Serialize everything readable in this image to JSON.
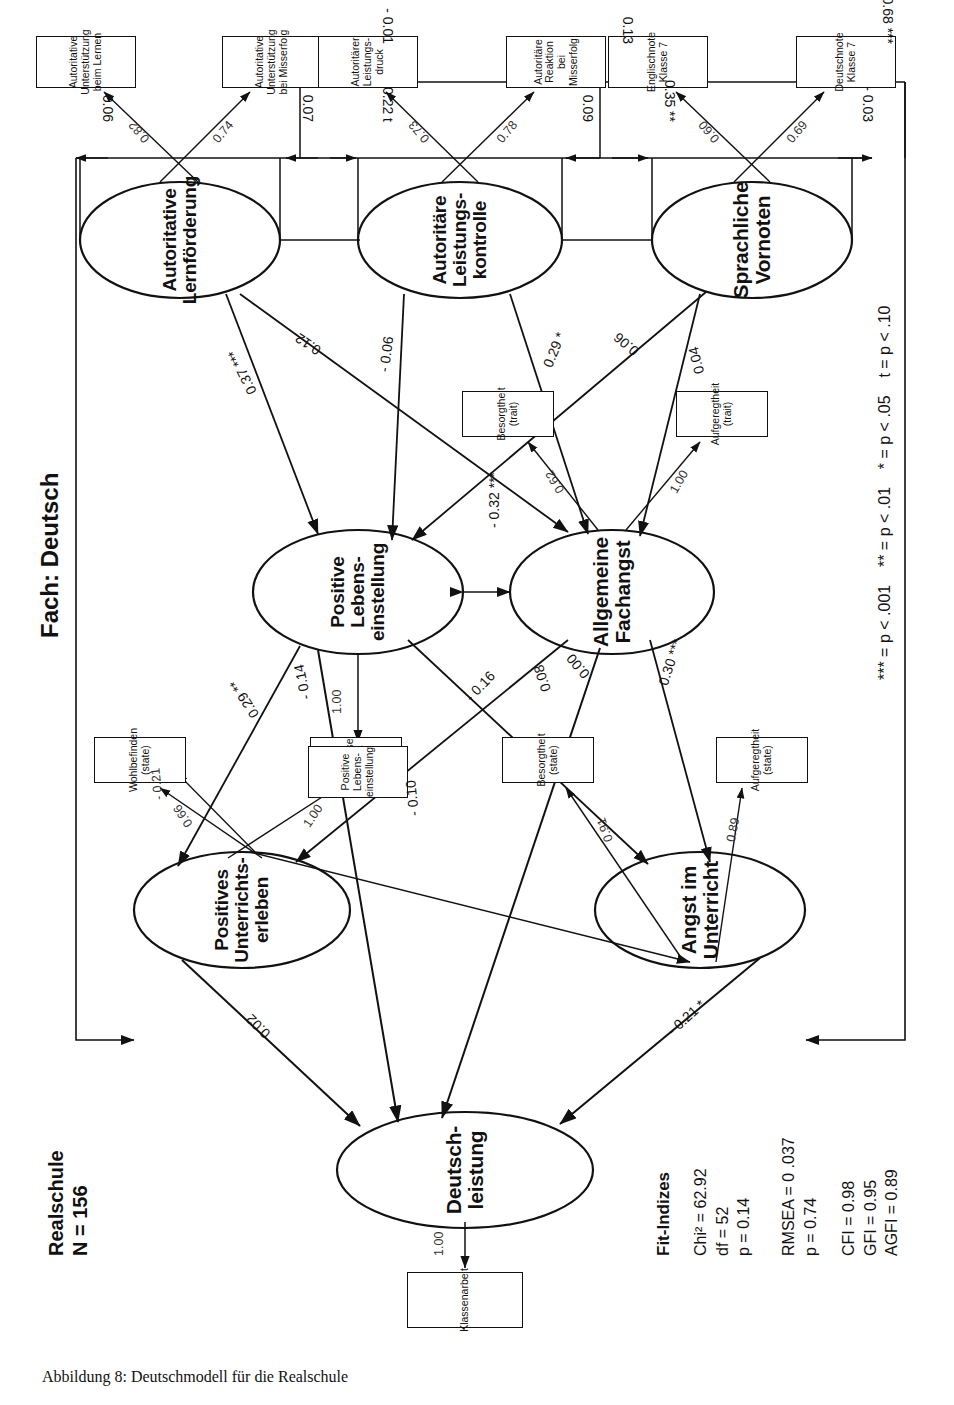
{
  "figure": {
    "caption": "Abbildung 8: Deutschmodell für die Realschule",
    "sample_header": "Realschule\nN = 156",
    "subject_header": "Fach: Deutsch"
  },
  "fit": {
    "title": "Fit-Indizes",
    "group1": "Chi² = 62.92\ndf = 52\np = 0.14",
    "group2": "RMSEA = 0 .037\np = 0.74",
    "group3": "CFI = 0.98\nGFI = 0.95\nAGFI = 0.89"
  },
  "legend": {
    "text": "*** = p < .001    ** = p < .01    * = p < .05    t = p < .10"
  },
  "latents": [
    {
      "id": "deutschleistung",
      "label": "Deutsch-\nleistung"
    },
    {
      "id": "pos_unterricht",
      "label": "Positives\nUnterrichts-\nerleben"
    },
    {
      "id": "angst_unterricht",
      "label": "Angst im\nUnterricht"
    },
    {
      "id": "pos_leben",
      "label": "Positive\nLebens-\neinstellung"
    },
    {
      "id": "allg_fachangst",
      "label": "Allgemeine\nFachangst"
    },
    {
      "id": "aut_lernfoerder",
      "label": "Autoritative\nLernförderung"
    },
    {
      "id": "aut_leistkontr",
      "label": "Autoritäre\nLeistungs-\nkontrolle"
    },
    {
      "id": "spr_vornoten",
      "label": "Sprachliche\nVornoten"
    }
  ],
  "indicators": [
    {
      "id": "klassenarbeit",
      "label": "Klassenarbeit",
      "loading": "1.00"
    },
    {
      "id": "wohlbefinden",
      "label": "Wohlbefinden\n(state)",
      "loading": "0.66"
    },
    {
      "id": "interesse",
      "label": "Interesse\n(state)",
      "loading": "1.00"
    },
    {
      "id": "besorgtheit_state",
      "label": "Besorgtheit\n(state)",
      "loading": "0.91"
    },
    {
      "id": "aufgeregt_state",
      "label": "Aufgeregtheit\n(state)",
      "loading": "0.89"
    },
    {
      "id": "pos_leben_ind",
      "label": "Positive\nLebens-\neinstellung",
      "loading": "1.00"
    },
    {
      "id": "besorgtheit_trait",
      "label": "Besorgtheit\n(trait)",
      "loading": "0.62"
    },
    {
      "id": "aufgeregt_trait",
      "label": "Aufgeregtheit\n(trait)",
      "loading": "1.00"
    },
    {
      "id": "aut_unt_lernen",
      "label": "Autoritative\nUnterstützung\nbeim Lernen",
      "loading": "0.82"
    },
    {
      "id": "aut_unt_misserf",
      "label": "Autoritative\nUnterstützung\nbei Misserfolg",
      "loading": "0.74"
    },
    {
      "id": "aut_leistdruck",
      "label": "Autoritärer\nLeistungs-\ndruck",
      "loading": "0.73"
    },
    {
      "id": "aut_reakt_misserf",
      "label": "Autoritäre\nReaktion bei\nMisserfolg",
      "loading": "0.78"
    },
    {
      "id": "englischnote",
      "label": "Englischnote\nKlasse 7",
      "loading": "0.60"
    },
    {
      "id": "deutschnote",
      "label": "Deutschnote\nKlasse 7",
      "loading": "0.69"
    }
  ],
  "paths": {
    "pos_unterricht_to_leistung": "0.02",
    "angst_to_leistung": "- 0.21 *",
    "pos_unterricht_to_angst": "- 0.10",
    "pos_unterricht_to_besorgtheit_state": "- 0.21",
    "pos_leben_to_pos_unterricht": "0.29 **",
    "pos_leben_to_leistung": "- 0.14",
    "pos_leben_to_angst": "- 0.16",
    "fachangst_to_pos_unterricht": "0.08",
    "fachangst_to_leistung": "0.00",
    "fachangst_to_angst": "0.30 ***",
    "pos_leben_fachangst_corr": "- 0.32 ***",
    "lernfoerder_to_pos_leben": "0.37 ***",
    "lernfoerder_to_fachangst": "0.12",
    "leistkontr_to_pos_leben": "- 0.06",
    "leistkontr_to_fachangst": "0.29 *",
    "vornoten_to_pos_leben": "0.06",
    "vornoten_to_fachangst": "0.04"
  },
  "exogenous_correlations": {
    "row1": [
      {
        "id": "corr_lern_self",
        "value": "0.06"
      },
      {
        "id": "corr_lern_leistkontr",
        "value": "0.07"
      },
      {
        "id": "corr_leistkontr_t",
        "value": "0.22 t"
      },
      {
        "id": "corr_leistkontr_vorn",
        "value": "0.09"
      },
      {
        "id": "corr_vornoten",
        "value": "0.35 **"
      },
      {
        "id": "corr_vornoten_end",
        "value": "- 0.03"
      }
    ],
    "row2": [
      {
        "id": "corr_long_1",
        "value": "- 0.01"
      },
      {
        "id": "corr_long_2",
        "value": "0.13"
      },
      {
        "id": "corr_long_3",
        "value": "0.68 ***"
      }
    ]
  }
}
